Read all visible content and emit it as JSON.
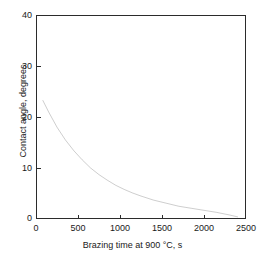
{
  "figure": {
    "background_color": "#ffffff",
    "axis_color": "#2b2b2b",
    "curve_color": "#1a1a1a"
  },
  "chart_data": {
    "type": "line",
    "title": "",
    "xlabel": "Brazing time at 900 °C, s",
    "ylabel": "Contact angle, degrees",
    "xlim": [
      0,
      2500
    ],
    "ylim": [
      0,
      40
    ],
    "xticks": [
      0,
      500,
      1000,
      1500,
      2000,
      2500
    ],
    "xticklabels": [
      "0",
      "500",
      "1000",
      "1500",
      "2000",
      "2500"
    ],
    "yticks": [
      0,
      10,
      20,
      30,
      40
    ],
    "yticklabels": [
      "0",
      "10",
      "20",
      "30",
      "40"
    ],
    "grid": false,
    "legend": false,
    "series": [
      {
        "name": "Contact angle vs brazing time",
        "x": [
          80,
          150,
          250,
          350,
          450,
          550,
          650,
          750,
          850,
          950,
          1050,
          1150,
          1250,
          1400,
          1550,
          1700,
          1850,
          2000,
          2150,
          2300,
          2405
        ],
        "y": [
          23.3,
          21.0,
          18.0,
          15.5,
          13.4,
          11.6,
          10.0,
          8.7,
          7.6,
          6.6,
          5.8,
          5.1,
          4.5,
          3.7,
          3.1,
          2.5,
          2.1,
          1.7,
          1.3,
          0.8,
          0.4
        ]
      }
    ]
  },
  "axes": {
    "y_tick_values": [
      {
        "label": "40",
        "top": 11
      },
      {
        "label": "30",
        "top": 62
      },
      {
        "label": "20",
        "top": 113
      },
      {
        "label": "10",
        "top": 164
      },
      {
        "label": "0",
        "top": 215
      }
    ],
    "x_tick_values": [
      {
        "label": "0",
        "left": 16
      },
      {
        "label": "500",
        "left": 58
      },
      {
        "label": "1000",
        "left": 100
      },
      {
        "label": "1500",
        "left": 142
      },
      {
        "label": "2000",
        "left": 184
      },
      {
        "label": "2500",
        "left": 226
      }
    ]
  }
}
